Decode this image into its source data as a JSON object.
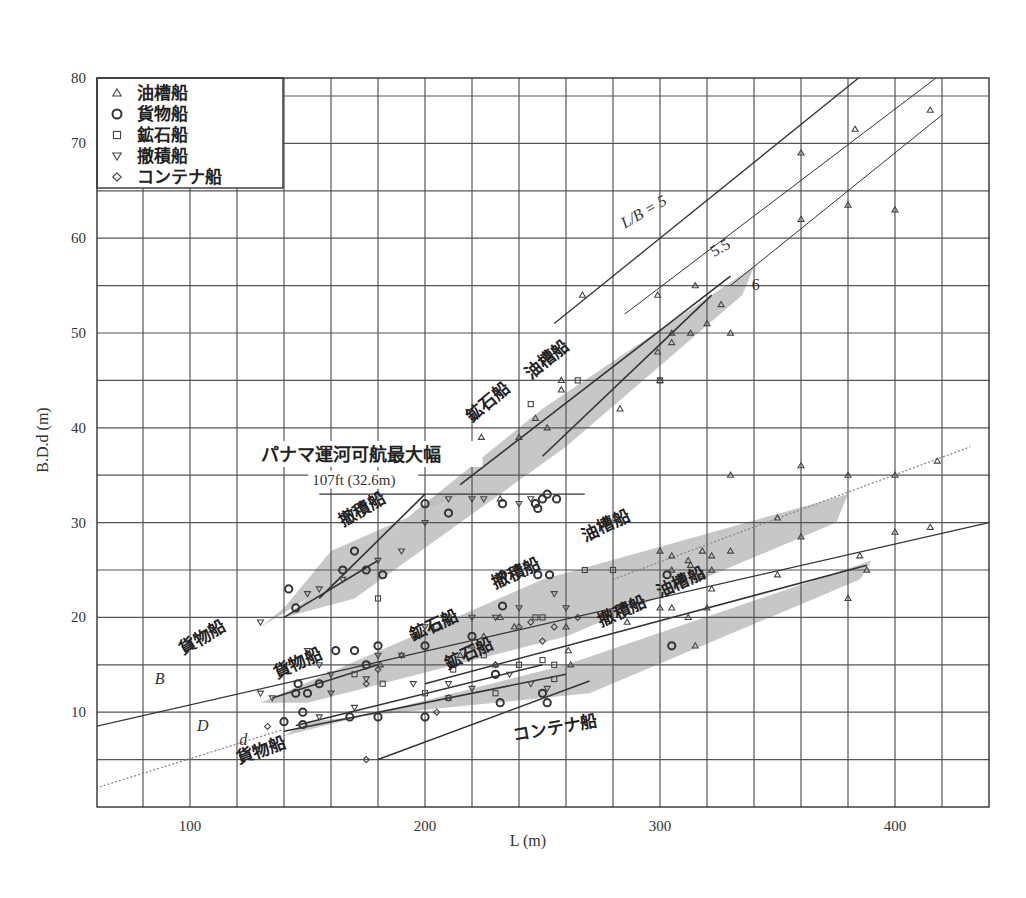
{
  "chart_data": {
    "type": "scatter",
    "title": "",
    "xlabel": "L (m)",
    "ylabel": "B.D.d (m)",
    "xlim": [
      60,
      440
    ],
    "ylim": [
      0,
      80
    ],
    "x_ticks": [
      100,
      200,
      300,
      400
    ],
    "y_ticks": [
      10,
      20,
      30,
      40,
      50,
      60,
      70,
      80
    ],
    "grid": true,
    "grid_step": {
      "x": 20,
      "y": 5
    },
    "legend_position": "upper-left",
    "legend": [
      {
        "symbol": "triangle",
        "glyph": "△",
        "label": "油槽船"
      },
      {
        "symbol": "circle",
        "glyph": "○",
        "label": "貨物船"
      },
      {
        "symbol": "square",
        "glyph": "□",
        "label": "鉱石船"
      },
      {
        "symbol": "inverted-triangle",
        "glyph": "▽",
        "label": "撤積船"
      },
      {
        "symbol": "diamond",
        "glyph": "◇",
        "label": "コンテナ船"
      }
    ],
    "reference_lines": [
      {
        "name": "L/B = 5",
        "label": "L/B = 5",
        "points": [
          [
            255,
            51
          ],
          [
            420,
            84
          ]
        ]
      },
      {
        "name": "L/B = 5.5",
        "label": "5.5",
        "points": [
          [
            285,
            52
          ],
          [
            418,
            77
          ]
        ]
      },
      {
        "name": "L/B = 6",
        "label": "6",
        "points": [
          [
            330,
            55
          ],
          [
            420,
            73
          ]
        ]
      },
      {
        "name": "panama_max_beam",
        "label": "パナマ運河可航最大幅",
        "sublabel": "107ft (32.6m)",
        "points": [
          [
            155,
            33
          ],
          [
            268,
            33
          ]
        ]
      },
      {
        "name": "cargo_B_trend",
        "label": "B 貨物船",
        "points": [
          [
            60,
            8.5
          ],
          [
            440,
            30
          ]
        ]
      },
      {
        "name": "cargo_d_trend",
        "label": "d 貨物船",
        "style": "dotted",
        "points": [
          [
            60,
            2
          ],
          [
            140,
            8.2
          ]
        ]
      },
      {
        "name": "tanker_B_trend",
        "style": "dotted",
        "points": [
          [
            280,
            24
          ],
          [
            432,
            38
          ]
        ]
      }
    ],
    "bands": [
      {
        "name": "B_bulk",
        "label": "撤積船",
        "polygon": [
          [
            130,
            19
          ],
          [
            150,
            22
          ],
          [
            205,
            33
          ],
          [
            215,
            33
          ],
          [
            160,
            27
          ],
          [
            140,
            21
          ]
        ]
      },
      {
        "name": "B_ore_tanker",
        "label": "鉱石船 油槽船",
        "polygon": [
          [
            140,
            20
          ],
          [
            250,
            42
          ],
          [
            340,
            57
          ],
          [
            335,
            54
          ],
          [
            260,
            38
          ],
          [
            170,
            22
          ]
        ]
      },
      {
        "name": "D_ore_bulk_tanker",
        "label": "鉱石船 撤積船 油槽船",
        "polygon": [
          [
            130,
            11
          ],
          [
            250,
            24
          ],
          [
            380,
            33
          ],
          [
            375,
            30
          ],
          [
            260,
            18
          ],
          [
            150,
            11
          ]
        ]
      },
      {
        "name": "d_cargo_ore_bulk_tanker",
        "label": "貨物船 鉱石船 撤積船 油槽船",
        "polygon": [
          [
            140,
            7.5
          ],
          [
            260,
            15
          ],
          [
            390,
            26
          ],
          [
            385,
            24
          ],
          [
            270,
            12
          ],
          [
            150,
            9
          ]
        ]
      }
    ],
    "line_fits": [
      {
        "group": "B 撤積船 upper",
        "points": [
          [
            155,
            22
          ],
          [
            200,
            33
          ]
        ]
      },
      {
        "group": "B 撤積船 lower",
        "points": [
          [
            140,
            20
          ],
          [
            180,
            26
          ]
        ]
      },
      {
        "group": "B 鉱石船/油槽船 upper",
        "points": [
          [
            215,
            34
          ],
          [
            330,
            56
          ]
        ]
      },
      {
        "group": "B 鉱石船/油槽船 lower",
        "points": [
          [
            250,
            37
          ],
          [
            322,
            54
          ]
        ]
      },
      {
        "group": "D 貨物船",
        "points": [
          [
            135,
            11.5
          ],
          [
            180,
            15
          ]
        ]
      },
      {
        "group": "d 貨物船 a",
        "points": [
          [
            140,
            8
          ],
          [
            260,
            14
          ]
        ]
      },
      {
        "group": "d 貨物船 b",
        "points": [
          [
            145,
            8.6
          ],
          [
            250,
            15
          ]
        ]
      },
      {
        "group": "d 撤積船/油槽船",
        "points": [
          [
            200,
            13
          ],
          [
            388,
            25.5
          ]
        ]
      },
      {
        "group": "d コンテナ船",
        "points": [
          [
            180,
            5
          ],
          [
            270,
            13.3
          ]
        ]
      }
    ],
    "series": [
      {
        "name": "油槽船",
        "symbol": "triangle",
        "points": [
          [
            267,
            54
          ],
          [
            299,
            54
          ],
          [
            305,
            50
          ],
          [
            315,
            55
          ],
          [
            313,
            50
          ],
          [
            320,
            51
          ],
          [
            326,
            53
          ],
          [
            330,
            50
          ],
          [
            299,
            48
          ],
          [
            305,
            49
          ],
          [
            300,
            45
          ],
          [
            283,
            42
          ],
          [
            258,
            45
          ],
          [
            258,
            44
          ],
          [
            247,
            41
          ],
          [
            252,
            40
          ],
          [
            240,
            39
          ],
          [
            224,
            39
          ],
          [
            232,
            32.5
          ],
          [
            360,
            69
          ],
          [
            383,
            71.5
          ],
          [
            415,
            73.5
          ],
          [
            360,
            62
          ],
          [
            380,
            63.5
          ],
          [
            400,
            63
          ],
          [
            330,
            35
          ],
          [
            360,
            36
          ],
          [
            380,
            35
          ],
          [
            400,
            35
          ],
          [
            418,
            36.5
          ],
          [
            350,
            30.5
          ],
          [
            360,
            28.5
          ],
          [
            385,
            26.5
          ],
          [
            400,
            29
          ],
          [
            415,
            29.5
          ],
          [
            300,
            27
          ],
          [
            305,
            26.5
          ],
          [
            312,
            26
          ],
          [
            318,
            27
          ],
          [
            322,
            26.5
          ],
          [
            330,
            27
          ],
          [
            305,
            25
          ],
          [
            313,
            25.5
          ],
          [
            322,
            25
          ],
          [
            318,
            24.5
          ],
          [
            350,
            24.5
          ],
          [
            380,
            22
          ],
          [
            388,
            25
          ],
          [
            322,
            23
          ],
          [
            320,
            21
          ],
          [
            312,
            20
          ],
          [
            305,
            21
          ],
          [
            300,
            21
          ],
          [
            286,
            19.5
          ],
          [
            260,
            19
          ],
          [
            262,
            15
          ],
          [
            225,
            18
          ],
          [
            220,
            17
          ],
          [
            232,
            20
          ],
          [
            238,
            19
          ],
          [
            230,
            15
          ],
          [
            215,
            16
          ],
          [
            190,
            16
          ],
          [
            181,
            15
          ],
          [
            315,
            17
          ],
          [
            261,
            16.5
          ]
        ]
      },
      {
        "name": "貨物船",
        "symbol": "circle",
        "points": [
          [
            142,
            23
          ],
          [
            145,
            21
          ],
          [
            165,
            25
          ],
          [
            170,
            27
          ],
          [
            175,
            25
          ],
          [
            182,
            24.5
          ],
          [
            200,
            32
          ],
          [
            210,
            31
          ],
          [
            233,
            32
          ],
          [
            247,
            32
          ],
          [
            248,
            31.5
          ],
          [
            250,
            32.5
          ],
          [
            252,
            33
          ],
          [
            256,
            32.5
          ],
          [
            248,
            24.5
          ],
          [
            253,
            24.5
          ],
          [
            233,
            24.5
          ],
          [
            162,
            16.5
          ],
          [
            170,
            16.5
          ],
          [
            175,
            15
          ],
          [
            180,
            17
          ],
          [
            146,
            13
          ],
          [
            155,
            13
          ],
          [
            150,
            12
          ],
          [
            205,
            19
          ],
          [
            200,
            17
          ],
          [
            220,
            18
          ],
          [
            230,
            14
          ],
          [
            250,
            12
          ],
          [
            252,
            11
          ],
          [
            140,
            9
          ],
          [
            148,
            10
          ],
          [
            148,
            8.7
          ],
          [
            168,
            9.5
          ],
          [
            180,
            9.5
          ],
          [
            200,
            9.5
          ],
          [
            232,
            11
          ],
          [
            305,
            17
          ],
          [
            233,
            21.2
          ],
          [
            303,
            24.5
          ],
          [
            145,
            12
          ]
        ]
      },
      {
        "name": "鉱石船",
        "symbol": "square",
        "points": [
          [
            245,
            42.5
          ],
          [
            265,
            45
          ],
          [
            300,
            45
          ],
          [
            180,
            22
          ],
          [
            210,
            20
          ],
          [
            225,
            16
          ],
          [
            230,
            12
          ],
          [
            240,
            15
          ],
          [
            250,
            15.5
          ],
          [
            255,
            15
          ],
          [
            268,
            25
          ],
          [
            280,
            25
          ],
          [
            247,
            20
          ],
          [
            250,
            20
          ],
          [
            170,
            14
          ],
          [
            182,
            13
          ],
          [
            212,
            14.5
          ],
          [
            255,
            13.5
          ],
          [
            200,
            12
          ],
          [
            210,
            11.5
          ]
        ]
      },
      {
        "name": "撤積船",
        "symbol": "inverted-triangle",
        "points": [
          [
            130,
            19.5
          ],
          [
            150,
            22.5
          ],
          [
            155,
            23
          ],
          [
            165,
            24
          ],
          [
            180,
            26
          ],
          [
            190,
            27
          ],
          [
            200,
            30
          ],
          [
            210,
            32.5
          ],
          [
            220,
            32.5
          ],
          [
            225,
            32.5
          ],
          [
            240,
            32
          ],
          [
            245,
            32.5
          ],
          [
            150,
            16.5
          ],
          [
            155,
            15
          ],
          [
            160,
            14
          ],
          [
            180,
            16
          ],
          [
            190,
            16
          ],
          [
            195,
            18
          ],
          [
            200,
            19
          ],
          [
            210,
            19.5
          ],
          [
            220,
            20
          ],
          [
            230,
            20
          ],
          [
            240,
            21
          ],
          [
            255,
            22.5
          ],
          [
            260,
            21
          ],
          [
            130,
            12
          ],
          [
            135,
            11.5
          ],
          [
            160,
            12
          ],
          [
            175,
            13.5
          ],
          [
            195,
            13
          ],
          [
            210,
            13
          ],
          [
            236,
            14
          ],
          [
            245,
            13
          ],
          [
            252,
            12.5
          ],
          [
            220,
            12.5
          ],
          [
            155,
            9.5
          ],
          [
            170,
            10.5
          ]
        ]
      },
      {
        "name": "コンテナ船",
        "symbol": "diamond",
        "points": [
          [
            175,
            5
          ],
          [
            205,
            10
          ],
          [
            210,
            11.5
          ],
          [
            230,
            15
          ],
          [
            240,
            19
          ],
          [
            245,
            19.5
          ],
          [
            255,
            19
          ],
          [
            265,
            20
          ],
          [
            175,
            13
          ],
          [
            180,
            14.5
          ],
          [
            133,
            8.5
          ],
          [
            250,
            17.5
          ]
        ]
      }
    ],
    "annotations": [
      {
        "text": "L/B = 5",
        "x": 285,
        "y": 61,
        "rotation": -30
      },
      {
        "text": "5.5",
        "x": 323,
        "y": 58,
        "rotation": -30
      },
      {
        "text": "6",
        "x": 339,
        "y": 54.5,
        "rotation": 0
      },
      {
        "text": "パナマ運河可航最大幅",
        "x": 130,
        "y": 36.5
      },
      {
        "text": "107ft (32.6m)",
        "x": 152,
        "y": 34
      },
      {
        "text": "撤積船",
        "x": 165,
        "y": 29.5,
        "rotation": -30
      },
      {
        "text": "鉱石船",
        "x": 220,
        "y": 40.5,
        "rotation": -40
      },
      {
        "text": "油槽船",
        "x": 245,
        "y": 45,
        "rotation": -40
      },
      {
        "text": "B",
        "x": 85,
        "y": 13
      },
      {
        "text": "貨物船",
        "x": 97,
        "y": 16,
        "rotation": -30
      },
      {
        "text": "貨物船",
        "x": 137,
        "y": 13.5,
        "rotation": -25
      },
      {
        "text": "鉱石船",
        "x": 195,
        "y": 17.5,
        "rotation": -25
      },
      {
        "text": "撤積船",
        "x": 230,
        "y": 23,
        "rotation": -25
      },
      {
        "text": "油槽船",
        "x": 268,
        "y": 28,
        "rotation": -25
      },
      {
        "text": "鉱石船",
        "x": 210,
        "y": 14.5,
        "rotation": -25
      },
      {
        "text": "撤積船",
        "x": 275,
        "y": 19,
        "rotation": -25
      },
      {
        "text": "油槽船",
        "x": 300,
        "y": 22,
        "rotation": -25
      },
      {
        "text": "D",
        "x": 103,
        "y": 8
      },
      {
        "text": "d",
        "x": 121,
        "y": 6.5
      },
      {
        "text": "貨物船",
        "x": 121,
        "y": 4.5,
        "rotation": -20
      },
      {
        "text": "コンテナ船",
        "x": 238,
        "y": 7,
        "rotation": -10
      }
    ]
  }
}
